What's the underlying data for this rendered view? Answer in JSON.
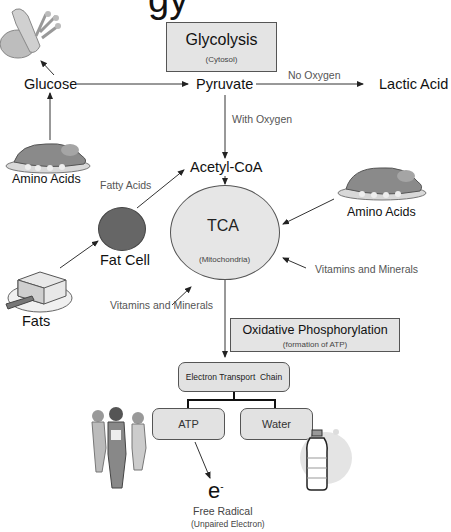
{
  "title_fragment": "gy",
  "glycolysis": {
    "title": "Glycolysis",
    "location": "(Cytosol)"
  },
  "nodes": {
    "glucose": "Glucose",
    "pyruvate": "Pyruvate",
    "lactic_acid": "Lactic Acid",
    "acetyl_coa": "Acetyl-CoA",
    "amino_acids_left": "Amino Acids",
    "amino_acids_right": "Amino Acids",
    "fat_cell": "Fat Cell",
    "fats": "Fats",
    "electron": "e",
    "electron_charge": "-",
    "free_radical": "Free Radical",
    "free_radical_note": "(Unpaired Electron)"
  },
  "edge_labels": {
    "no_oxygen": "No Oxygen",
    "with_oxygen": "With Oxygen",
    "fatty_acids": "Fatty Acids",
    "vitamins_right": "Vitamins and Minerals",
    "vitamins_left": "Vitamins and Minerals"
  },
  "tca": {
    "title": "TCA",
    "location": "(Mitochondria)"
  },
  "oxidative": {
    "title": "Oxidative Phosphorylation",
    "subtitle": "(formation of ATP)"
  },
  "etc": {
    "label": "Electron Transport  Chain",
    "children": [
      "ATP",
      "Water"
    ]
  },
  "illustrations": [
    "grain-bread",
    "roast-turkey",
    "roast-turkey",
    "butter-dish",
    "fat-cell",
    "exercising-people",
    "water-bottle"
  ],
  "colors": {
    "box_fill": "#e4e4e4",
    "tca_fill": "#e6e6e6",
    "fat_cell_fill": "#666666",
    "line": "#333333"
  }
}
